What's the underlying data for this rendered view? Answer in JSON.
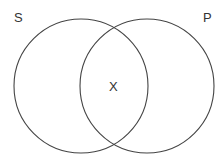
{
  "diagram": {
    "type": "venn",
    "sets": [
      {
        "label": "S",
        "cx": 81,
        "cy": 86,
        "r": 67
      },
      {
        "label": "P",
        "cx": 147,
        "cy": 86,
        "r": 67
      }
    ],
    "intersection_label": "X",
    "stroke_color": "#444444"
  }
}
